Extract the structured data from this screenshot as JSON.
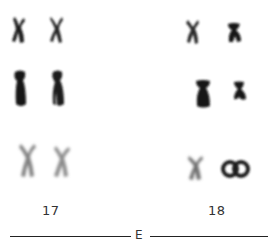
{
  "figure": {
    "type": "karyotype-excerpt",
    "group": "E",
    "pairs": [
      {
        "label": "17",
        "rows": [
          {
            "row": 1,
            "shade": "#222222",
            "morphology": "submetacentric-X"
          },
          {
            "row": 2,
            "shade": "#111111",
            "morphology": "elongated-dense"
          },
          {
            "row": 3,
            "shade": "#8a8a8a",
            "morphology": "submetacentric-X-pale"
          }
        ]
      },
      {
        "label": "18",
        "rows": [
          {
            "row": 1,
            "shade": "#2a2a2a",
            "morphology": "small-X"
          },
          {
            "row": 2,
            "shade": "#151515",
            "morphology": "small-dense"
          },
          {
            "row": 3,
            "shade": "#555555",
            "morphology": "pale-X-and-ring"
          }
        ]
      }
    ],
    "labels": {
      "pair_17": "17",
      "pair_18": "18",
      "group": "E"
    },
    "colors": {
      "background": "#ffffff",
      "ink": "#222222"
    }
  }
}
